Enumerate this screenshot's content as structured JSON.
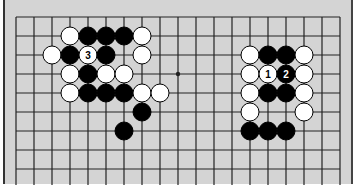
{
  "diagram": {
    "type": "go-board-diagram",
    "grid": {
      "columns": 19,
      "rows": 9,
      "origin_x": 16,
      "origin_y": 17,
      "step_x": 18,
      "step_y": 19
    },
    "star_points": [
      {
        "col": 9,
        "row": 3
      }
    ],
    "colors": {
      "background": "#d4d4d4",
      "line": "#222222",
      "black": "#000000",
      "white": "#ffffff"
    },
    "stones": [
      {
        "color": "white",
        "col": 3,
        "row": 1
      },
      {
        "color": "black",
        "col": 4,
        "row": 1
      },
      {
        "color": "black",
        "col": 5,
        "row": 1
      },
      {
        "color": "black",
        "col": 6,
        "row": 1
      },
      {
        "color": "white",
        "col": 7,
        "row": 1
      },
      {
        "color": "white",
        "col": 2,
        "row": 2
      },
      {
        "color": "black",
        "col": 3,
        "row": 2
      },
      {
        "color": "white",
        "col": 4,
        "row": 2,
        "label": "3"
      },
      {
        "color": "black",
        "col": 5,
        "row": 2
      },
      {
        "color": "white",
        "col": 7,
        "row": 2
      },
      {
        "color": "white",
        "col": 3,
        "row": 3
      },
      {
        "color": "black",
        "col": 4,
        "row": 3
      },
      {
        "color": "white",
        "col": 5,
        "row": 3
      },
      {
        "color": "white",
        "col": 6,
        "row": 3
      },
      {
        "color": "white",
        "col": 3,
        "row": 4
      },
      {
        "color": "black",
        "col": 4,
        "row": 4
      },
      {
        "color": "black",
        "col": 5,
        "row": 4
      },
      {
        "color": "black",
        "col": 6,
        "row": 4
      },
      {
        "color": "white",
        "col": 7,
        "row": 4
      },
      {
        "color": "white",
        "col": 8,
        "row": 4
      },
      {
        "color": "black",
        "col": 7,
        "row": 5
      },
      {
        "color": "black",
        "col": 6,
        "row": 6
      },
      {
        "color": "white",
        "col": 13,
        "row": 2
      },
      {
        "color": "black",
        "col": 14,
        "row": 2
      },
      {
        "color": "black",
        "col": 15,
        "row": 2
      },
      {
        "color": "white",
        "col": 16,
        "row": 2
      },
      {
        "color": "white",
        "col": 13,
        "row": 3
      },
      {
        "color": "white",
        "col": 14,
        "row": 3,
        "label": "1"
      },
      {
        "color": "black",
        "col": 15,
        "row": 3,
        "label": "2"
      },
      {
        "color": "white",
        "col": 16,
        "row": 3
      },
      {
        "color": "white",
        "col": 13,
        "row": 4
      },
      {
        "color": "black",
        "col": 14,
        "row": 4
      },
      {
        "color": "black",
        "col": 15,
        "row": 4
      },
      {
        "color": "white",
        "col": 16,
        "row": 4
      },
      {
        "color": "white",
        "col": 13,
        "row": 5
      },
      {
        "color": "white",
        "col": 16,
        "row": 5
      },
      {
        "color": "black",
        "col": 13,
        "row": 6
      },
      {
        "color": "black",
        "col": 14,
        "row": 6
      },
      {
        "color": "black",
        "col": 15,
        "row": 6
      }
    ]
  }
}
